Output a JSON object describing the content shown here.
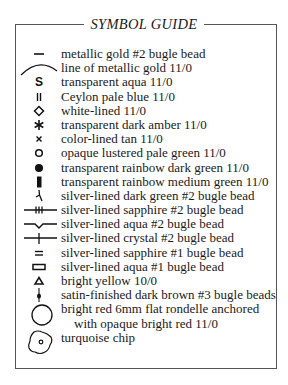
{
  "title": "SYMBOL GUIDE",
  "items": [
    {
      "icon": "short-dash-icon",
      "label": "metallic gold #2 bugle bead"
    },
    {
      "icon": "arc-line-icon",
      "label": "line of metallic gold 11/0"
    },
    {
      "icon": "letter-s-icon",
      "label": "transparent aqua 11/0"
    },
    {
      "icon": "double-bar-icon",
      "label": "Ceylon pale blue 11/0"
    },
    {
      "icon": "diamond-outline-icon",
      "label": "white-lined 11/0"
    },
    {
      "icon": "asterisk-icon",
      "label": "transparent dark amber 11/0"
    },
    {
      "icon": "x-cross-icon",
      "label": "color-lined tan 11/0"
    },
    {
      "icon": "circle-outline-icon",
      "label": "opaque lustered pale green 11/0"
    },
    {
      "icon": "filled-circle-icon",
      "label": "transparent rainbow dark green 11/0"
    },
    {
      "icon": "filled-rectangle-icon",
      "label": "transparent rainbow medium green 11/0"
    },
    {
      "icon": "squiggle-stroke-icon",
      "label": "silver-lined dark green #2 bugle bead"
    },
    {
      "icon": "triple-tick-line-icon",
      "label": "silver-lined sapphire #2 bugle bead"
    },
    {
      "icon": "v-notch-line-icon",
      "label": "silver-lined aqua #2 bugle bead"
    },
    {
      "icon": "single-tick-line-icon",
      "label": "silver-lined crystal #2 bugle bead"
    },
    {
      "icon": "equals-icon",
      "label": "silver-lined sapphire #1 bugle bead"
    },
    {
      "icon": "rectangle-outline-icon",
      "label": "silver-lined aqua #1 bugle bead"
    },
    {
      "icon": "triangle-outline-icon",
      "label": "bright yellow 10/0"
    },
    {
      "icon": "dot-stem-icon",
      "label": "satin-finished dark brown #3 bugle beads"
    },
    {
      "icon": "large-circle-icon",
      "label": "bright red 6mm flat rondelle anchored"
    },
    {
      "icon": "none",
      "label": "with opaque bright red 11/0",
      "indent": true
    },
    {
      "icon": "chip-outline-icon",
      "label": "turquoise chip"
    }
  ]
}
